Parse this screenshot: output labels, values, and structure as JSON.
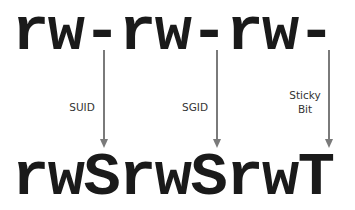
{
  "before": "rw-rw-rw-",
  "after": "rwSrwSrwT",
  "arrows": [
    {
      "label": "SUID"
    },
    {
      "label": "SGID"
    },
    {
      "label_line1": "Sticky",
      "label_line2": "Bit"
    }
  ],
  "colors": {
    "text": "#1a1a1a",
    "arrow": "#7a7a7a"
  }
}
